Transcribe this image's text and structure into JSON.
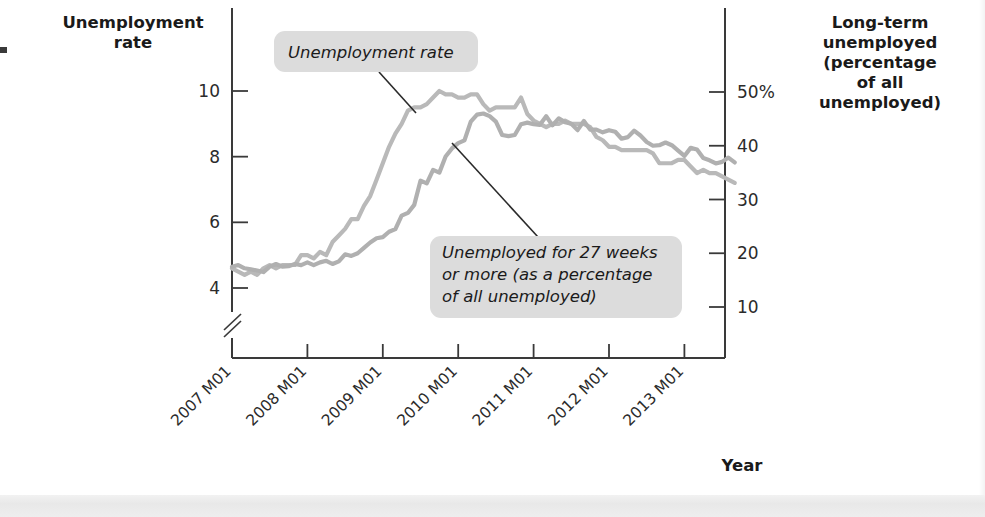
{
  "chart_data": {
    "type": "line",
    "title": "",
    "xlabel": "Year",
    "x_tick_labels": [
      "2007 M01",
      "2008 M01",
      "2009 M01",
      "2010 M01",
      "2011 M01",
      "2012 M01",
      "2013 M01"
    ],
    "grid": false,
    "legend_position": "inline-callouts",
    "left_axis": {
      "label_line1": "Unemployment",
      "label_line2": "rate",
      "ticks": [
        "4",
        "6",
        "8",
        "10"
      ],
      "tick_values": [
        4,
        6,
        8,
        10
      ],
      "ylim": [
        3.4,
        11.0
      ],
      "axis_break": true
    },
    "right_axis": {
      "label_line1": "Long-term",
      "label_line2": "unemployed",
      "label_line3": "(percentage",
      "label_line4": "of all",
      "label_line5": "unemployed)",
      "ticks": [
        "50%",
        "40",
        "30",
        "20",
        "10"
      ],
      "tick_values": [
        50,
        40,
        30,
        20,
        10
      ],
      "ylim": [
        3,
        58
      ]
    },
    "annotations": [
      {
        "name": "unemployment-rate-callout",
        "text": "Unemployment rate"
      },
      {
        "name": "long-term-unemployed-callout",
        "line1": "Unemployed for 27 weeks",
        "line2": "or more (as a percentage",
        "line3": "of all unemployed)"
      }
    ],
    "series": [
      {
        "name": "Unemployment rate",
        "axis": "left",
        "color": "#b9b9b9",
        "x": [
          2007.0,
          2007.083,
          2007.167,
          2007.25,
          2007.333,
          2007.417,
          2007.5,
          2007.583,
          2007.667,
          2007.75,
          2007.833,
          2007.917,
          2008.0,
          2008.083,
          2008.167,
          2008.25,
          2008.333,
          2008.417,
          2008.5,
          2008.583,
          2008.667,
          2008.75,
          2008.833,
          2008.917,
          2009.0,
          2009.083,
          2009.167,
          2009.25,
          2009.333,
          2009.417,
          2009.5,
          2009.583,
          2009.667,
          2009.75,
          2009.833,
          2009.917,
          2010.0,
          2010.083,
          2010.167,
          2010.25,
          2010.333,
          2010.417,
          2010.5,
          2010.583,
          2010.667,
          2010.75,
          2010.833,
          2010.917,
          2011.0,
          2011.083,
          2011.167,
          2011.25,
          2011.333,
          2011.417,
          2011.5,
          2011.583,
          2011.667,
          2011.75,
          2011.833,
          2011.917,
          2012.0,
          2012.083,
          2012.167,
          2012.25,
          2012.333,
          2012.417,
          2012.5,
          2012.583,
          2012.667,
          2012.75,
          2012.833,
          2012.917,
          2013.0,
          2013.083,
          2013.167,
          2013.25,
          2013.333,
          2013.417,
          2013.5,
          2013.583,
          2013.667
        ],
        "values": [
          4.6,
          4.5,
          4.4,
          4.5,
          4.4,
          4.6,
          4.7,
          4.6,
          4.7,
          4.7,
          4.7,
          5.0,
          5.0,
          4.9,
          5.1,
          5.0,
          5.4,
          5.6,
          5.8,
          6.1,
          6.1,
          6.5,
          6.8,
          7.3,
          7.8,
          8.3,
          8.7,
          9.0,
          9.4,
          9.5,
          9.5,
          9.6,
          9.8,
          10.0,
          9.9,
          9.9,
          9.8,
          9.8,
          9.9,
          9.9,
          9.6,
          9.4,
          9.5,
          9.5,
          9.5,
          9.5,
          9.8,
          9.3,
          9.1,
          9.0,
          8.9,
          9.0,
          9.0,
          9.1,
          9.0,
          9.0,
          9.0,
          8.9,
          8.6,
          8.5,
          8.3,
          8.3,
          8.2,
          8.2,
          8.2,
          8.2,
          8.2,
          8.1,
          7.8,
          7.8,
          7.8,
          7.9,
          7.9,
          7.7,
          7.5,
          7.6,
          7.5,
          7.5,
          7.4,
          7.3,
          7.2
        ]
      },
      {
        "name": "Unemployed for 27 weeks or more (as a percentage of all unemployed)",
        "axis": "right",
        "color": "#b0b0b0",
        "x": [
          2007.0,
          2007.083,
          2007.167,
          2007.25,
          2007.333,
          2007.417,
          2007.5,
          2007.583,
          2007.667,
          2007.75,
          2007.833,
          2007.917,
          2008.0,
          2008.083,
          2008.167,
          2008.25,
          2008.333,
          2008.417,
          2008.5,
          2008.583,
          2008.667,
          2008.75,
          2008.833,
          2008.917,
          2009.0,
          2009.083,
          2009.167,
          2009.25,
          2009.333,
          2009.417,
          2009.5,
          2009.583,
          2009.667,
          2009.75,
          2009.833,
          2009.917,
          2010.0,
          2010.083,
          2010.167,
          2010.25,
          2010.333,
          2010.417,
          2010.5,
          2010.583,
          2010.667,
          2010.75,
          2010.833,
          2010.917,
          2011.0,
          2011.083,
          2011.167,
          2011.25,
          2011.333,
          2011.417,
          2011.5,
          2011.583,
          2011.667,
          2011.75,
          2011.833,
          2011.917,
          2012.0,
          2012.083,
          2012.167,
          2012.25,
          2012.333,
          2012.417,
          2012.5,
          2012.583,
          2012.667,
          2012.75,
          2012.833,
          2012.917,
          2013.0,
          2013.083,
          2013.167,
          2013.25,
          2013.333,
          2013.417,
          2013.5,
          2013.583,
          2013.667
        ],
        "values": [
          17.5,
          17.8,
          17.2,
          17.0,
          16.8,
          16.5,
          17.5,
          18.0,
          17.5,
          17.6,
          18.0,
          17.8,
          18.3,
          17.8,
          18.3,
          18.6,
          18.0,
          18.5,
          19.8,
          19.5,
          20.0,
          21.0,
          22.0,
          22.8,
          23.0,
          24.0,
          24.5,
          27.0,
          27.5,
          29.0,
          33.5,
          33.0,
          35.5,
          35.0,
          38.0,
          39.5,
          40.5,
          41.0,
          44.5,
          45.8,
          46.0,
          45.5,
          44.5,
          42.0,
          41.8,
          42.0,
          44.0,
          44.3,
          44.0,
          43.9,
          45.5,
          43.8,
          45.1,
          44.4,
          44.1,
          42.9,
          44.6,
          43.0,
          43.0,
          42.5,
          42.9,
          42.6,
          41.3,
          41.6,
          42.8,
          41.9,
          40.7,
          40.0,
          40.1,
          40.6,
          40.1,
          39.1,
          38.1,
          39.6,
          39.3,
          37.7,
          37.3,
          36.7,
          37.0,
          37.8,
          36.9
        ]
      }
    ]
  },
  "footer": {
    "x_axis_title": "Year"
  }
}
